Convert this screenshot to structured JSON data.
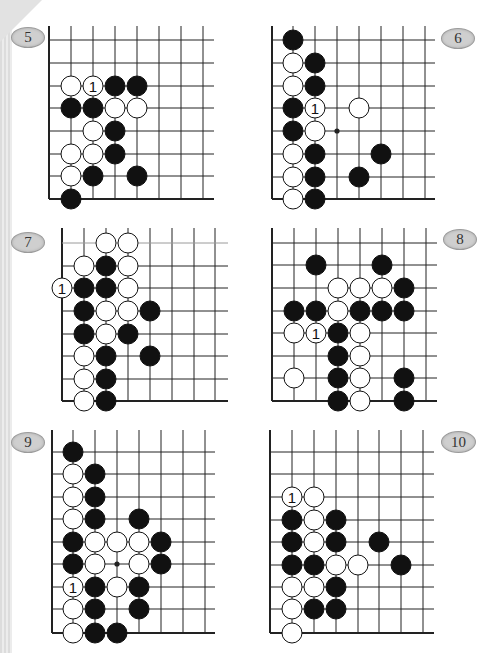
{
  "page": {
    "background": "#ffffff",
    "stone_black": "#111111",
    "stone_white": "#ffffff",
    "line_color": "#222222"
  },
  "diagrams": [
    {
      "id": "5",
      "label": "5",
      "badge": {
        "x": 11,
        "y": 27,
        "w": 32,
        "h": 19
      },
      "grid": {
        "xs": [
          49,
          71,
          93,
          115,
          137,
          159,
          181,
          203
        ],
        "ys": [
          40,
          63,
          86,
          108,
          131,
          154,
          176,
          199
        ],
        "top": 26,
        "right": 214,
        "left_edge": true,
        "bottom_edge": true,
        "top_edge": false
      },
      "stones": [
        {
          "c": 1,
          "r": 2,
          "color": "W"
        },
        {
          "c": 2,
          "r": 2,
          "color": "W",
          "label": "1"
        },
        {
          "c": 3,
          "r": 2,
          "color": "B"
        },
        {
          "c": 4,
          "r": 2,
          "color": "B"
        },
        {
          "c": 1,
          "r": 3,
          "color": "B"
        },
        {
          "c": 2,
          "r": 3,
          "color": "B"
        },
        {
          "c": 3,
          "r": 3,
          "color": "W"
        },
        {
          "c": 4,
          "r": 3,
          "color": "W"
        },
        {
          "c": 2,
          "r": 4,
          "color": "W"
        },
        {
          "c": 3,
          "r": 4,
          "color": "B"
        },
        {
          "c": 1,
          "r": 5,
          "color": "W"
        },
        {
          "c": 2,
          "r": 5,
          "color": "W"
        },
        {
          "c": 3,
          "r": 5,
          "color": "B"
        },
        {
          "c": 1,
          "r": 6,
          "color": "W"
        },
        {
          "c": 2,
          "r": 6,
          "color": "B"
        },
        {
          "c": 4,
          "r": 6,
          "color": "B"
        },
        {
          "c": 1,
          "r": 7,
          "color": "B"
        }
      ],
      "star_points": []
    },
    {
      "id": "6",
      "label": "6",
      "badge": {
        "x": 441,
        "y": 28,
        "w": 32,
        "h": 19
      },
      "grid": {
        "xs": [
          272,
          293,
          315,
          337,
          359,
          381,
          403,
          425
        ],
        "ys": [
          40,
          63,
          86,
          108,
          131,
          154,
          177,
          199
        ],
        "top": 26,
        "right": 435,
        "left_edge": true,
        "bottom_edge": true,
        "top_edge": false
      },
      "stones": [
        {
          "c": 1,
          "r": 0,
          "color": "B"
        },
        {
          "c": 1,
          "r": 1,
          "color": "W"
        },
        {
          "c": 2,
          "r": 1,
          "color": "B"
        },
        {
          "c": 1,
          "r": 2,
          "color": "W"
        },
        {
          "c": 2,
          "r": 2,
          "color": "B"
        },
        {
          "c": 1,
          "r": 3,
          "color": "B"
        },
        {
          "c": 2,
          "r": 3,
          "color": "W",
          "label": "1"
        },
        {
          "c": 4,
          "r": 3,
          "color": "W"
        },
        {
          "c": 1,
          "r": 4,
          "color": "B"
        },
        {
          "c": 2,
          "r": 4,
          "color": "W"
        },
        {
          "c": 1,
          "r": 5,
          "color": "W"
        },
        {
          "c": 2,
          "r": 5,
          "color": "B"
        },
        {
          "c": 5,
          "r": 5,
          "color": "B"
        },
        {
          "c": 1,
          "r": 6,
          "color": "W"
        },
        {
          "c": 2,
          "r": 6,
          "color": "B"
        },
        {
          "c": 4,
          "r": 6,
          "color": "B"
        },
        {
          "c": 1,
          "r": 7,
          "color": "W"
        },
        {
          "c": 2,
          "r": 7,
          "color": "B"
        }
      ],
      "star_points": [
        {
          "c": 3,
          "r": 4
        }
      ]
    },
    {
      "id": "7",
      "label": "7",
      "badge": {
        "x": 11,
        "y": 232,
        "w": 32,
        "h": 19
      },
      "grid": {
        "xs": [
          62,
          84,
          106,
          128,
          150,
          172,
          194,
          215
        ],
        "ys": [
          243,
          266,
          288,
          311,
          334,
          356,
          379,
          401
        ],
        "top": 228,
        "right": 228,
        "left_edge": true,
        "bottom_edge": true,
        "top_edge": false,
        "first_row_light": true
      },
      "stones": [
        {
          "c": 2,
          "r": 0,
          "color": "W"
        },
        {
          "c": 3,
          "r": 0,
          "color": "W"
        },
        {
          "c": 1,
          "r": 1,
          "color": "W"
        },
        {
          "c": 2,
          "r": 1,
          "color": "B"
        },
        {
          "c": 3,
          "r": 1,
          "color": "W"
        },
        {
          "c": 0,
          "r": 2,
          "color": "W",
          "label": "1"
        },
        {
          "c": 1,
          "r": 2,
          "color": "B"
        },
        {
          "c": 2,
          "r": 2,
          "color": "B"
        },
        {
          "c": 3,
          "r": 2,
          "color": "W"
        },
        {
          "c": 1,
          "r": 3,
          "color": "B"
        },
        {
          "c": 2,
          "r": 3,
          "color": "W"
        },
        {
          "c": 3,
          "r": 3,
          "color": "W"
        },
        {
          "c": 4,
          "r": 3,
          "color": "B"
        },
        {
          "c": 1,
          "r": 4,
          "color": "B"
        },
        {
          "c": 2,
          "r": 4,
          "color": "W"
        },
        {
          "c": 3,
          "r": 4,
          "color": "B"
        },
        {
          "c": 1,
          "r": 5,
          "color": "W"
        },
        {
          "c": 2,
          "r": 5,
          "color": "B"
        },
        {
          "c": 4,
          "r": 5,
          "color": "B"
        },
        {
          "c": 1,
          "r": 6,
          "color": "W"
        },
        {
          "c": 2,
          "r": 6,
          "color": "B"
        },
        {
          "c": 1,
          "r": 7,
          "color": "W"
        },
        {
          "c": 2,
          "r": 7,
          "color": "B"
        }
      ],
      "star_points": []
    },
    {
      "id": "8",
      "label": "8",
      "badge": {
        "x": 443,
        "y": 229,
        "w": 32,
        "h": 19
      },
      "grid": {
        "xs": [
          272,
          294,
          316,
          338,
          360,
          382,
          404,
          426
        ],
        "ys": [
          243,
          265,
          288,
          311,
          333,
          356,
          378,
          401
        ],
        "top": 228,
        "right": 437,
        "left_edge": true,
        "bottom_edge": true,
        "top_edge": false
      },
      "stones": [
        {
          "c": 2,
          "r": 1,
          "color": "B"
        },
        {
          "c": 5,
          "r": 1,
          "color": "B"
        },
        {
          "c": 3,
          "r": 2,
          "color": "W"
        },
        {
          "c": 4,
          "r": 2,
          "color": "W"
        },
        {
          "c": 5,
          "r": 2,
          "color": "W"
        },
        {
          "c": 6,
          "r": 2,
          "color": "B"
        },
        {
          "c": 1,
          "r": 3,
          "color": "B"
        },
        {
          "c": 2,
          "r": 3,
          "color": "B"
        },
        {
          "c": 3,
          "r": 3,
          "color": "W"
        },
        {
          "c": 4,
          "r": 3,
          "color": "B"
        },
        {
          "c": 5,
          "r": 3,
          "color": "B"
        },
        {
          "c": 6,
          "r": 3,
          "color": "B"
        },
        {
          "c": 1,
          "r": 4,
          "color": "W"
        },
        {
          "c": 2,
          "r": 4,
          "color": "W",
          "label": "1"
        },
        {
          "c": 3,
          "r": 4,
          "color": "B"
        },
        {
          "c": 4,
          "r": 4,
          "color": "W"
        },
        {
          "c": 3,
          "r": 5,
          "color": "B"
        },
        {
          "c": 4,
          "r": 5,
          "color": "W"
        },
        {
          "c": 1,
          "r": 6,
          "color": "W"
        },
        {
          "c": 3,
          "r": 6,
          "color": "B"
        },
        {
          "c": 4,
          "r": 6,
          "color": "W"
        },
        {
          "c": 6,
          "r": 6,
          "color": "B"
        },
        {
          "c": 3,
          "r": 7,
          "color": "B"
        },
        {
          "c": 4,
          "r": 7,
          "color": "W"
        },
        {
          "c": 6,
          "r": 7,
          "color": "B"
        }
      ],
      "star_points": []
    },
    {
      "id": "9",
      "label": "9",
      "badge": {
        "x": 11,
        "y": 432,
        "w": 32,
        "h": 19
      },
      "grid": {
        "xs": [
          52,
          73,
          95,
          117,
          139,
          161,
          183,
          205
        ],
        "ys": [
          452,
          474,
          497,
          519,
          542,
          564,
          587,
          609,
          633
        ],
        "top": 430,
        "right": 215,
        "left_edge": true,
        "bottom_edge": true,
        "top_edge": false
      },
      "stones": [
        {
          "c": 1,
          "r": 0,
          "color": "B"
        },
        {
          "c": 1,
          "r": 1,
          "color": "W"
        },
        {
          "c": 2,
          "r": 1,
          "color": "B"
        },
        {
          "c": 1,
          "r": 2,
          "color": "W"
        },
        {
          "c": 2,
          "r": 2,
          "color": "B"
        },
        {
          "c": 1,
          "r": 3,
          "color": "W"
        },
        {
          "c": 2,
          "r": 3,
          "color": "B"
        },
        {
          "c": 4,
          "r": 3,
          "color": "B"
        },
        {
          "c": 1,
          "r": 4,
          "color": "B"
        },
        {
          "c": 2,
          "r": 4,
          "color": "W"
        },
        {
          "c": 3,
          "r": 4,
          "color": "W"
        },
        {
          "c": 4,
          "r": 4,
          "color": "W"
        },
        {
          "c": 5,
          "r": 4,
          "color": "B"
        },
        {
          "c": 1,
          "r": 5,
          "color": "B"
        },
        {
          "c": 2,
          "r": 5,
          "color": "W"
        },
        {
          "c": 4,
          "r": 5,
          "color": "W"
        },
        {
          "c": 5,
          "r": 5,
          "color": "B"
        },
        {
          "c": 1,
          "r": 6,
          "color": "W",
          "label": "1"
        },
        {
          "c": 2,
          "r": 6,
          "color": "B"
        },
        {
          "c": 3,
          "r": 6,
          "color": "W"
        },
        {
          "c": 4,
          "r": 6,
          "color": "B"
        },
        {
          "c": 1,
          "r": 7,
          "color": "W"
        },
        {
          "c": 2,
          "r": 7,
          "color": "B"
        },
        {
          "c": 4,
          "r": 7,
          "color": "B"
        },
        {
          "c": 1,
          "r": 8,
          "color": "W"
        },
        {
          "c": 2,
          "r": 8,
          "color": "B"
        },
        {
          "c": 3,
          "r": 8,
          "color": "B"
        }
      ],
      "star_points": [
        {
          "c": 3,
          "r": 5
        }
      ]
    },
    {
      "id": "10",
      "label": "10",
      "badge": {
        "x": 441,
        "y": 431,
        "w": 33,
        "h": 20
      },
      "grid": {
        "xs": [
          270,
          292,
          314,
          336,
          358,
          379,
          401,
          423
        ],
        "ys": [
          452,
          474,
          497,
          520,
          542,
          565,
          587,
          609,
          633
        ],
        "top": 430,
        "right": 434,
        "left_edge": true,
        "bottom_edge": true,
        "top_edge": false
      },
      "stones": [
        {
          "c": 1,
          "r": 2,
          "color": "W",
          "label": "1"
        },
        {
          "c": 2,
          "r": 2,
          "color": "W"
        },
        {
          "c": 1,
          "r": 3,
          "color": "B"
        },
        {
          "c": 2,
          "r": 3,
          "color": "W"
        },
        {
          "c": 3,
          "r": 3,
          "color": "B"
        },
        {
          "c": 1,
          "r": 4,
          "color": "B"
        },
        {
          "c": 2,
          "r": 4,
          "color": "W"
        },
        {
          "c": 3,
          "r": 4,
          "color": "B"
        },
        {
          "c": 5,
          "r": 4,
          "color": "B"
        },
        {
          "c": 1,
          "r": 5,
          "color": "B"
        },
        {
          "c": 2,
          "r": 5,
          "color": "B"
        },
        {
          "c": 3,
          "r": 5,
          "color": "W"
        },
        {
          "c": 4,
          "r": 5,
          "color": "W"
        },
        {
          "c": 6,
          "r": 5,
          "color": "B"
        },
        {
          "c": 1,
          "r": 6,
          "color": "W"
        },
        {
          "c": 2,
          "r": 6,
          "color": "W"
        },
        {
          "c": 3,
          "r": 6,
          "color": "B"
        },
        {
          "c": 1,
          "r": 7,
          "color": "W"
        },
        {
          "c": 2,
          "r": 7,
          "color": "B"
        },
        {
          "c": 3,
          "r": 7,
          "color": "B"
        },
        {
          "c": 1,
          "r": 8,
          "color": "W"
        }
      ],
      "star_points": []
    }
  ]
}
